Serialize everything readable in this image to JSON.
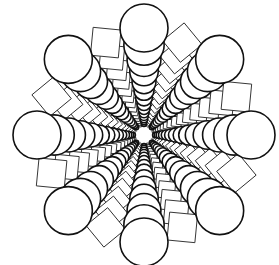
{
  "figure": {
    "center": [
      144,
      135
    ],
    "colors": {
      "background": "#ffffff",
      "circle_stroke": "#111111",
      "square_stroke": "#2a2a2a",
      "fill": "#ffffff"
    },
    "circle_arms": {
      "count": 8,
      "start_angle_deg": -90,
      "outer_distance": 107,
      "outer_radius": 24,
      "steps": 14,
      "scale": 0.84
    },
    "square_arms": {
      "count": 8,
      "start_angle_deg": -67.5,
      "outer_distance": 100,
      "outer_size": 28,
      "steps": 14,
      "scale": 0.84
    }
  }
}
